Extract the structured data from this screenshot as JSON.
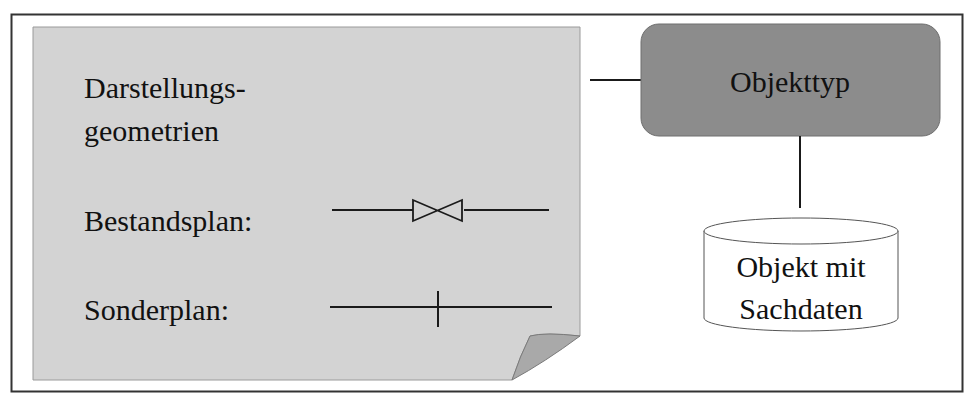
{
  "diagram": {
    "page": {
      "title_line1": "Darstellungs-",
      "title_line2": "geometrien",
      "rows": [
        {
          "label": "Bestandsplan:",
          "symbol": "valve-symbol"
        },
        {
          "label": "Sonderplan:",
          "symbol": "tick-line-symbol"
        }
      ]
    },
    "object_type": {
      "label": "Objekttyp"
    },
    "object_store": {
      "label_line1": "Objekt mit",
      "label_line2": "Sachdaten"
    }
  },
  "colors": {
    "page_fill": "#d3d3d3",
    "object_type_fill": "#8c8c8c",
    "lines": "#1a1a1a",
    "frame": "#333333"
  }
}
